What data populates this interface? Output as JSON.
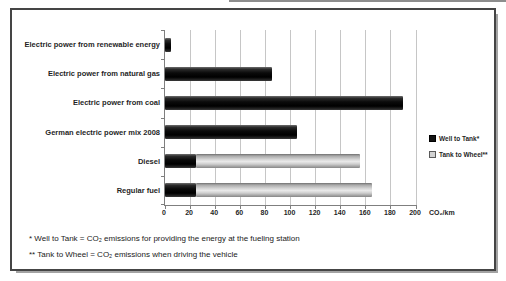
{
  "chart_data": {
    "type": "bar",
    "orientation": "horizontal",
    "stacked": true,
    "title": "",
    "categories": [
      "Electric power from renewable energy",
      "Electric power from natural gas",
      "Electric power from coal",
      "German electric power mix 2008",
      "Diesel",
      "Regular fuel"
    ],
    "series": [
      {
        "name": "Well to Tank*",
        "color": "#0d0d0d",
        "values": [
          5,
          85,
          190,
          105,
          25,
          25
        ]
      },
      {
        "name": "Tank to Wheel**",
        "color": "#cfcfcf",
        "values": [
          0,
          0,
          0,
          0,
          130,
          140
        ]
      }
    ],
    "xlabel": "CO₂/km",
    "ylabel": "",
    "xlim": [
      0,
      200
    ],
    "xticks": [
      0,
      20,
      40,
      60,
      80,
      100,
      120,
      140,
      160,
      180,
      200
    ],
    "grid": true,
    "legend_position": "right"
  },
  "footnotes": [
    "* Well to Tank = CO₂ emissions for providing the energy at the fueling station",
    "** Tank to Wheel = CO₂ emissions when driving the vehicle"
  ],
  "colors": {
    "well_to_tank": "#0d0d0d",
    "tank_to_wheel": "#cfcfcf",
    "gridline": "#c6c6c6",
    "axis_line": "#7f7f7f",
    "frame_border": "#454545",
    "frame_shadow": "#a3a3a3",
    "text": "#1f1f1f"
  }
}
